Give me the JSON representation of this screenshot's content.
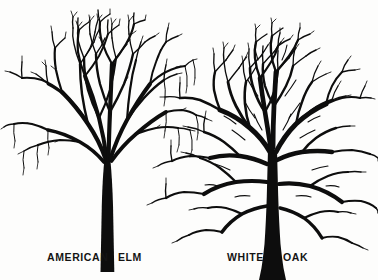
{
  "illustration": {
    "title": "Tree Silhouette Comparison",
    "background_color": "#fdfdfc",
    "ink_color": "#0d0d0d",
    "style": "black-ink winter tree silhouette botanical plate"
  },
  "trees": [
    {
      "id": "american-elm",
      "common_name": "American Elm",
      "label_part_1": "AMERICAN",
      "label_part_2": "ELM",
      "crown_form": "vase",
      "position": "left",
      "relative_height": "taller",
      "trunk": "single straight column splitting high into arching limbs",
      "crown_top_y": 14,
      "crown_left_x": 8,
      "crown_right_x": 188,
      "trunk_base_y": 272,
      "trunk_center_x": 107
    },
    {
      "id": "white-oak",
      "common_name": "White Oak",
      "label_part_1": "WHITE",
      "label_part_2": "OAK",
      "crown_form": "broad rounded spreading",
      "position": "right",
      "relative_height": "shorter and wider",
      "trunk": "thick trunk flaring at base with heavy low horizontal limbs",
      "crown_top_y": 70,
      "crown_left_x": 152,
      "crown_right_x": 376,
      "trunk_base_y": 280,
      "trunk_center_x": 272
    }
  ],
  "labels": {
    "elm_left": "AMERICAN",
    "elm_right": "ELM",
    "oak_left": "WHITE",
    "oak_right": "OAK"
  },
  "colors": {
    "ink": "#0d0d0d",
    "paper": "#fdfdfc",
    "text": "#141414"
  }
}
